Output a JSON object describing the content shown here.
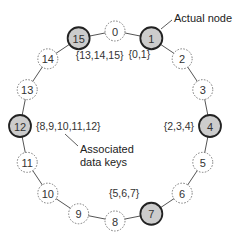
{
  "diagram": {
    "ring_size": 16,
    "nodes": [
      {
        "id": "0",
        "actual": false
      },
      {
        "id": "1",
        "actual": true,
        "keys": "{0,1}"
      },
      {
        "id": "2",
        "actual": false
      },
      {
        "id": "3",
        "actual": false
      },
      {
        "id": "4",
        "actual": true,
        "keys": "{2,3,4}"
      },
      {
        "id": "5",
        "actual": false
      },
      {
        "id": "6",
        "actual": false
      },
      {
        "id": "7",
        "actual": true,
        "keys": "{5,6,7}"
      },
      {
        "id": "8",
        "actual": false
      },
      {
        "id": "9",
        "actual": false
      },
      {
        "id": "10",
        "actual": false
      },
      {
        "id": "11",
        "actual": false
      },
      {
        "id": "12",
        "actual": true,
        "keys": "{8,9,10,11,12}"
      },
      {
        "id": "13",
        "actual": false
      },
      {
        "id": "14",
        "actual": false
      },
      {
        "id": "15",
        "actual": true,
        "keys": "{13,14,15}"
      }
    ],
    "annotations": {
      "actual_node": "Actual node",
      "associated_line1": "Associated",
      "associated_line2": "data keys"
    },
    "colors": {
      "actual_fill": "#cccccc",
      "virtual_fill": "#ffffff"
    }
  }
}
